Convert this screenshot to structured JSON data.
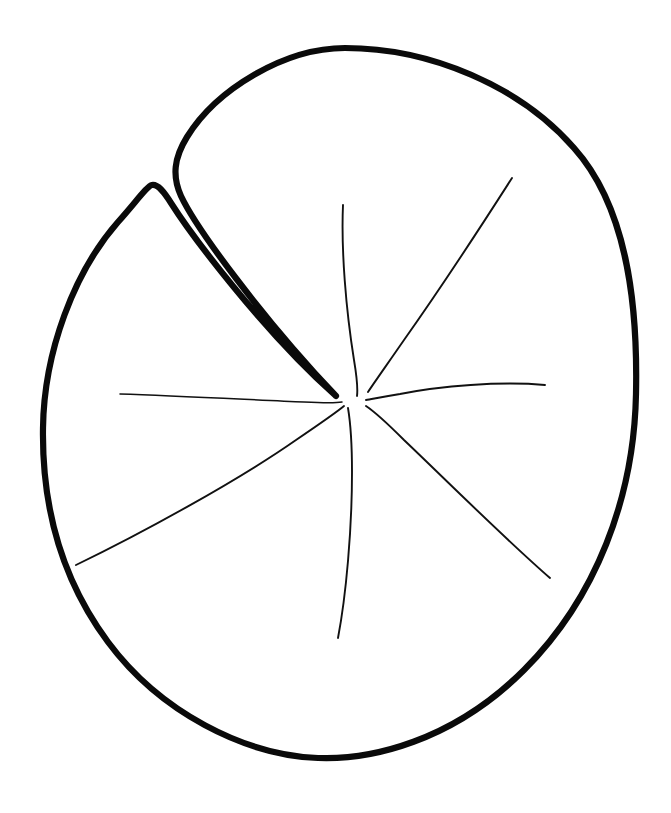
{
  "document": {
    "kind": "line-art-illustration",
    "subject": "water lily pad leaf",
    "style": "black outline coloring page",
    "background_color": "#ffffff",
    "outline_color": "#0a0a0a",
    "vein_color": "#111111",
    "canvas": {
      "width": 671,
      "height": 813
    }
  },
  "figure": {
    "outline": {
      "name": "leaf-outline",
      "stroke_width": 6.2,
      "description": "Rounded oval leaf blade with a deep V-shaped sinus cut from the upper-left edge down to the center point",
      "extremes": {
        "top_y": 48,
        "bottom_y": 758,
        "left_x": 42,
        "right_x": 636,
        "top_apex_x": 345,
        "bottom_apex_x": 320,
        "left_lobe_apex": [
          152,
          185
        ],
        "sinus_inner_point": [
          336,
          396
        ]
      },
      "path": "M 345 48 C 430 48 520 86 574 148 C 626 206 638 300 636 394 C 634 498 596 598 524 670 C 452 742 370 760 318 758 C 244 755 160 712 108 642 C 56 572 42 494 43 428 C 44 352 74 272 118 222 C 136 202 147 186 152 185 C 158 184 164 192 171 203 C 190 233 262 330 336 396 C 262 318 196 228 181 196 C 172 176 174 158 187 137 C 216 90 284 48 345 48 Z"
    },
    "veins": [
      {
        "name": "vein-upper",
        "path": "M 343 205 C 341 250 346 310 354 360 C 357 378 358 388 357 396",
        "start": [
          343,
          205
        ],
        "end": [
          357,
          396
        ]
      },
      {
        "name": "vein-upper-right",
        "path": "M 512 178 C 480 228 438 292 404 340 C 386 366 374 383 368 392",
        "start": [
          512,
          178
        ],
        "end": [
          368,
          392
        ]
      },
      {
        "name": "vein-right",
        "path": "M 545 385 C 500 381 440 386 400 394 C 382 397 372 399 366 400",
        "start": [
          545,
          385
        ],
        "end": [
          366,
          400
        ]
      },
      {
        "name": "vein-lower-right",
        "path": "M 550 578 C 504 538 444 478 404 440 C 384 420 372 410 366 406",
        "start": [
          550,
          578
        ],
        "end": [
          366,
          406
        ]
      },
      {
        "name": "vein-lower",
        "path": "M 338 638 C 346 596 352 530 352 472 C 352 440 350 420 348 408",
        "start": [
          338,
          638
        ],
        "end": [
          348,
          408
        ]
      },
      {
        "name": "vein-lower-left",
        "path": "M 76 565 C 140 534 236 482 296 440 C 324 421 338 411 344 406",
        "start": [
          76,
          565
        ],
        "end": [
          344,
          406
        ]
      },
      {
        "name": "vein-left",
        "path": "M 120 394 C 180 396 256 400 304 402 C 326 403 336 403 342 402",
        "start": [
          120,
          394
        ],
        "end": [
          342,
          402
        ]
      }
    ]
  }
}
